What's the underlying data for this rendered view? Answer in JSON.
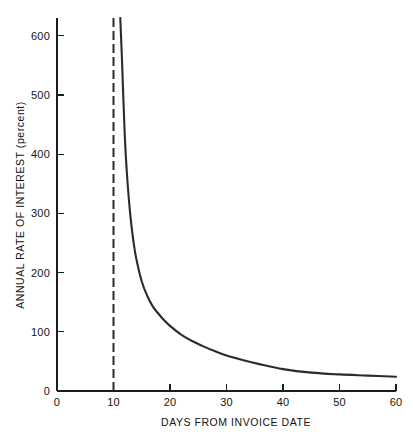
{
  "chart_data": {
    "type": "line",
    "title": "",
    "subtitle": "",
    "xlabel": "DAYS FROM INVOICE DATE",
    "ylabel": "ANNUAL RATE OF INTEREST (percent)",
    "xlim": [
      0,
      60
    ],
    "ylim": [
      0,
      630
    ],
    "grid": false,
    "legend": null,
    "xticks": [
      0,
      10,
      20,
      30,
      40,
      50,
      60
    ],
    "xtick_labels": [
      "0",
      "10",
      "20",
      "30",
      "40",
      "50",
      "60"
    ],
    "yticks": [
      0,
      100,
      200,
      300,
      400,
      500,
      600
    ],
    "ytick_labels": [
      "0",
      "100",
      "200",
      "300",
      "400",
      "500",
      "600"
    ],
    "series": [
      {
        "name": "Annual rate of interest",
        "style": "solid",
        "color": "#2b2b2b",
        "x": [
          11.2,
          11.5,
          12,
          12.5,
          13,
          13.5,
          14,
          15,
          16,
          17,
          18,
          19,
          20,
          22,
          24,
          26,
          28,
          30,
          33,
          36,
          40,
          45,
          50,
          55,
          60
        ],
        "y": [
          630,
          560,
          430,
          350,
          295,
          255,
          225,
          185,
          160,
          142,
          130,
          119,
          110,
          95,
          84,
          75,
          67,
          60,
          52,
          45,
          37,
          31,
          28,
          26,
          24
        ]
      }
    ],
    "annotations": [
      {
        "name": "discount-period-asymptote",
        "type": "vertical-dashed-line",
        "x": 10,
        "y_from": 0,
        "y_to": 630,
        "style": "dashed",
        "color": "#2b2b2b",
        "label": ""
      }
    ]
  },
  "axes": {
    "origin_label": "0",
    "x_axis_name": "x-axis",
    "y_axis_name": "y-axis"
  },
  "colors": {
    "background": "#ffffff",
    "ink": "#1c1c1c",
    "curve": "#2b2b2b"
  }
}
